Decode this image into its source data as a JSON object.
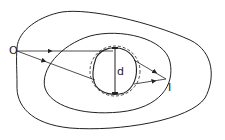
{
  "diagram": {
    "labels": {
      "object_point": "O",
      "image_point": "I",
      "diameter": "d"
    },
    "colors": {
      "stroke": "#222222",
      "background": "#ffffff"
    }
  }
}
